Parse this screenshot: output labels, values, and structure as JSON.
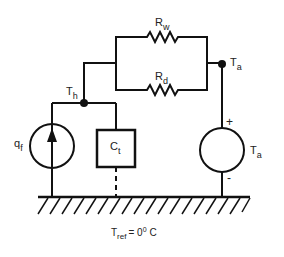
{
  "diagram": {
    "type": "thermal-circuit",
    "components": {
      "resistor_top": {
        "label": "R",
        "subscript": "w"
      },
      "resistor_bottom": {
        "label": "R",
        "subscript": "d"
      },
      "heat_source": {
        "label": "q",
        "subscript": "f"
      },
      "capacitor": {
        "label": "C",
        "subscript": "t"
      },
      "voltage_source": {
        "label": "T",
        "subscript": "a",
        "plus": "+",
        "minus": "-"
      }
    },
    "nodes": {
      "hot": {
        "label": "T",
        "subscript": "h"
      },
      "ambient": {
        "label": "T",
        "subscript": "a"
      }
    },
    "reference": {
      "label": "T",
      "subscript": "ref",
      "value": "= 0",
      "superscript": "0",
      "unit": "C"
    },
    "colors": {
      "line": "#111111",
      "background": "#ffffff"
    }
  }
}
